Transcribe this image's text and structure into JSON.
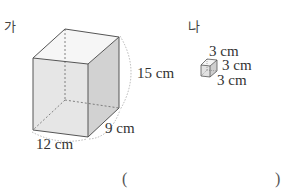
{
  "figures": [
    {
      "id": "ga",
      "label": "가",
      "shape": "rectangular-prism",
      "dimensions": {
        "height": "15 cm",
        "width": "12 cm",
        "depth": "9 cm"
      }
    },
    {
      "id": "na",
      "label": "나",
      "shape": "cube",
      "dimensions": {
        "top": "3 cm",
        "right": "3 cm",
        "bottom": "3 cm"
      }
    }
  ],
  "answer": {
    "open": "(",
    "close": ")",
    "value": ""
  },
  "colors": {
    "face_front": "#e4e4e4",
    "face_right": "#d0d0d0",
    "edge": "#555555"
  }
}
